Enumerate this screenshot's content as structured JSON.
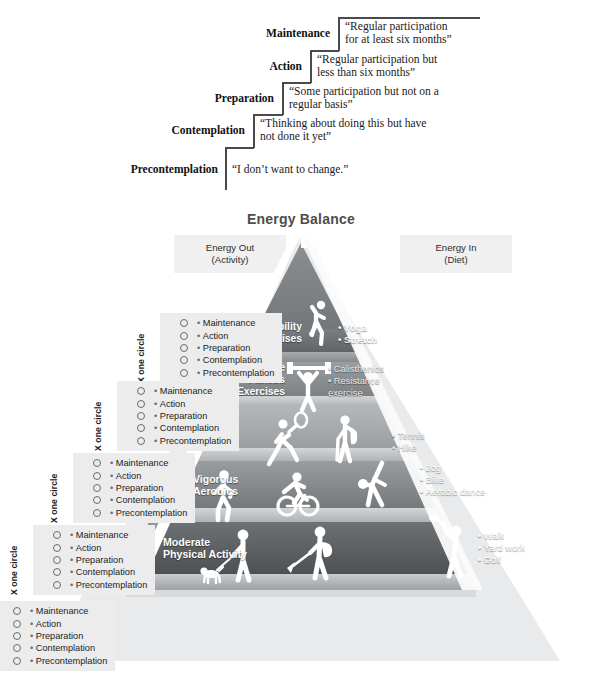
{
  "stages_of_change": {
    "steps": [
      {
        "label": "Maintenance",
        "quote": "“Regular participation\nfor at least six months”"
      },
      {
        "label": "Action",
        "quote": "“Regular participation but\nless than six months”"
      },
      {
        "label": "Preparation",
        "quote": "“Some participation but not on a\nregular basis”"
      },
      {
        "label": "Contemplation",
        "quote": "“Thinking about doing this but have\nnot done it yet”"
      },
      {
        "label": "Precontemplation",
        "quote": "“I don’t want to change.”"
      }
    ]
  },
  "energy_balance": {
    "title": "Energy Balance",
    "left_box": "Energy Out\n(Activity)",
    "left_box_line1": "Energy Out",
    "left_box_line2": "(Activity)",
    "right_box_line1": "Energy In",
    "right_box_line2": "(Diet)"
  },
  "pyramid": {
    "tiers": [
      {
        "name": "flexibility-exercises",
        "title": "Flexibility\nExercises",
        "items": [
          "Yoga",
          "Stretch"
        ],
        "icons": [
          "stretching-person-icon"
        ]
      },
      {
        "name": "muscle-fitness-exercises",
        "title": "Muscle\nFitness\nExercises",
        "items": [
          "Calisthenics",
          "Resistance\nexercise"
        ],
        "icons": [
          "weightlifter-icon"
        ]
      },
      {
        "name": "vigorous-sports-and-recreation",
        "title": "Vigorous Sports\nand Recreation",
        "items": [
          "Tennis",
          "Hike"
        ],
        "icons": [
          "tennis-player-icon",
          "hiker-icon"
        ]
      },
      {
        "name": "vigorous-aerobics",
        "title": "Vigorous\nAerobics",
        "items": [
          "Jog",
          "Bike",
          "Aerobic dance"
        ],
        "icons": [
          "jogger-icon",
          "cyclist-icon",
          "aerobic-dancer-icon"
        ]
      },
      {
        "name": "moderate-physical-activity",
        "title": "Moderate\nPhysical Activity",
        "items": [
          "Walk",
          "Yard work",
          "Golf"
        ],
        "icons": [
          "dog-walker-icon",
          "raking-person-icon",
          "golfer-icon"
        ]
      }
    ]
  },
  "stage_checklists": {
    "vertical_label": "X one circle",
    "options": [
      "Maintenance",
      "Action",
      "Preparation",
      "Contemplation",
      "Precontemplation"
    ],
    "count": 5
  },
  "colors": {
    "title_gray": "#4d4d4d",
    "box_gray": "#f0f0f0",
    "checklist_gray": "#ececec",
    "tier_top": "#6f7274",
    "tier_2": "#8d9193",
    "tier_3": "#a8abad",
    "tier_4": "#8b8e90",
    "tier_5": "#5f6264",
    "pyramid_edge": "#ffffff"
  }
}
